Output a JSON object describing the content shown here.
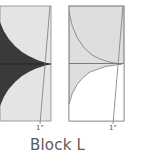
{
  "diagram": {
    "title": "Block L",
    "blocks": [
      {
        "id": "left",
        "dimension_label": "1\"",
        "fill_light": "#e4e4e4",
        "fill_dark": "#3a3a3a"
      },
      {
        "id": "right",
        "dimension_label": "1\"",
        "fill_light": "#dedede",
        "fill_white": "#ffffff"
      }
    ],
    "colors": {
      "outline": "#8a8a8a",
      "seam": "#6e6e6e"
    }
  }
}
